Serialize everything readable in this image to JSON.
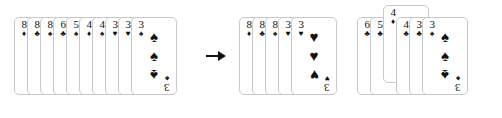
{
  "scene": {
    "background_color": "#ffffff",
    "card_border_color": "#c9c9c9",
    "pip_color": "#111111",
    "description": "Playing card hand transformation illustration"
  },
  "arrow": {
    "name": "transform-arrow",
    "glyph": "→",
    "color": "#111111"
  },
  "groups": [
    {
      "id": "hand-before",
      "label": "hand-before",
      "left": 14,
      "top": 17,
      "overlap": 13,
      "cards": [
        {
          "rank": "8",
          "suit": "♦",
          "suit_name": "diamonds",
          "color": "#111111",
          "pips": 0,
          "lifted": false
        },
        {
          "rank": "8",
          "suit": "♣",
          "suit_name": "clubs",
          "color": "#111111",
          "pips": 0,
          "lifted": false
        },
        {
          "rank": "8",
          "suit": "♠",
          "suit_name": "spades",
          "color": "#111111",
          "pips": 0,
          "lifted": false
        },
        {
          "rank": "6",
          "suit": "♣",
          "suit_name": "clubs",
          "color": "#111111",
          "pips": 0,
          "lifted": false
        },
        {
          "rank": "5",
          "suit": "♠",
          "suit_name": "spades",
          "color": "#111111",
          "pips": 0,
          "lifted": false
        },
        {
          "rank": "4",
          "suit": "♦",
          "suit_name": "diamonds",
          "color": "#111111",
          "pips": 0,
          "lifted": false
        },
        {
          "rank": "4",
          "suit": "♠",
          "suit_name": "spades",
          "color": "#111111",
          "pips": 0,
          "lifted": false
        },
        {
          "rank": "3",
          "suit": "♥",
          "suit_name": "hearts",
          "color": "#111111",
          "pips": 0,
          "lifted": false
        },
        {
          "rank": "3",
          "suit": "♥",
          "suit_name": "hearts",
          "color": "#111111",
          "pips": 0,
          "lifted": false
        },
        {
          "rank": "3",
          "suit": "♠",
          "suit_name": "spades",
          "color": "#111111",
          "pips": 3,
          "lifted": false
        }
      ]
    },
    {
      "id": "hand-after",
      "label": "hand-after",
      "left": 239,
      "top": 17,
      "overlap": 13,
      "cards": [
        {
          "rank": "8",
          "suit": "♦",
          "suit_name": "diamonds",
          "color": "#111111",
          "pips": 0,
          "lifted": false
        },
        {
          "rank": "8",
          "suit": "♣",
          "suit_name": "clubs",
          "color": "#111111",
          "pips": 0,
          "lifted": false
        },
        {
          "rank": "8",
          "suit": "♠",
          "suit_name": "spades",
          "color": "#111111",
          "pips": 0,
          "lifted": false
        },
        {
          "rank": "3",
          "suit": "♥",
          "suit_name": "hearts",
          "color": "#111111",
          "pips": 0,
          "lifted": false
        },
        {
          "rank": "3",
          "suit": "♥",
          "suit_name": "hearts",
          "color": "#111111",
          "pips": 3,
          "lifted": false
        }
      ]
    },
    {
      "id": "hand-remainder",
      "label": "hand-remainder",
      "left": 357,
      "top": 17,
      "overlap": 13,
      "cards": [
        {
          "rank": "6",
          "suit": "♣",
          "suit_name": "clubs",
          "color": "#111111",
          "pips": 0,
          "lifted": false
        },
        {
          "rank": "5",
          "suit": "♣",
          "suit_name": "clubs",
          "color": "#111111",
          "pips": 0,
          "lifted": false
        },
        {
          "rank": "4",
          "suit": "♦",
          "suit_name": "diamonds",
          "color": "#111111",
          "pips": 0,
          "lifted": true
        },
        {
          "rank": "4",
          "suit": "♣",
          "suit_name": "clubs",
          "color": "#111111",
          "pips": 0,
          "lifted": false
        },
        {
          "rank": "3",
          "suit": "♣",
          "suit_name": "clubs",
          "color": "#111111",
          "pips": 0,
          "lifted": false
        },
        {
          "rank": "3",
          "suit": "♠",
          "suit_name": "spades",
          "color": "#111111",
          "pips": 3,
          "lifted": false
        }
      ]
    }
  ]
}
